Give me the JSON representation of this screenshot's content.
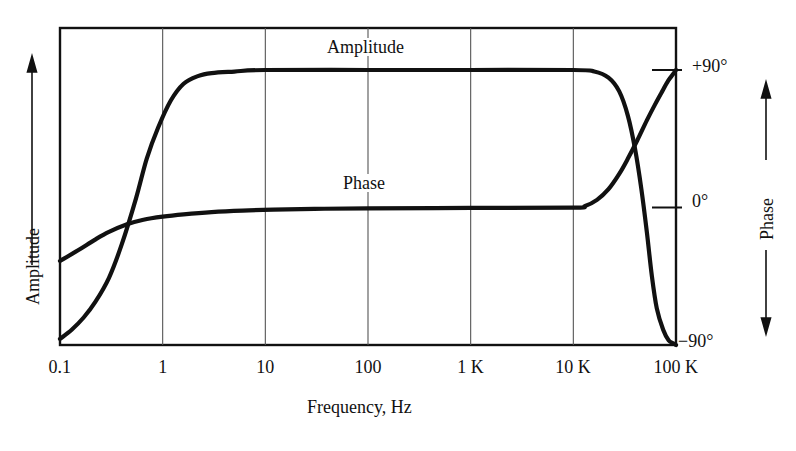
{
  "figure": {
    "background_color": "#ffffff",
    "ink_color": "#111111",
    "grid_color": "#555555"
  },
  "chart_data": {
    "type": "line",
    "title": "",
    "subtitle": "",
    "xlabel": "Frequency, Hz",
    "ylabel_left": "Amplitude",
    "ylabel_right": "Phase",
    "x_scale": "log",
    "x_tick_labels": [
      "0.1",
      "1",
      "10",
      "100",
      "1 K",
      "10 K",
      "100 K"
    ],
    "x_tick_values": [
      0.1,
      1,
      10,
      100,
      1000,
      10000,
      100000
    ],
    "xlim": [
      0.1,
      100000
    ],
    "y_right_tick_labels": [
      "+90°",
      "0°",
      "−90°"
    ],
    "y_right_tick_values": [
      90,
      0,
      -90
    ],
    "ylim_right": [
      -90,
      90
    ],
    "grid": true,
    "grid_axis": "x",
    "legend": "inline-labels",
    "series": [
      {
        "name": "Amplitude",
        "label": "Amplitude",
        "label_x": 100,
        "axis": "left",
        "points_xy": [
          [
            0.1,
            -86
          ],
          [
            0.13,
            -80
          ],
          [
            0.17,
            -72
          ],
          [
            0.22,
            -62
          ],
          [
            0.3,
            -46
          ],
          [
            0.4,
            -24
          ],
          [
            0.55,
            6
          ],
          [
            0.7,
            32
          ],
          [
            0.9,
            52
          ],
          [
            1.2,
            70
          ],
          [
            1.6,
            81
          ],
          [
            2.2,
            86
          ],
          [
            3,
            88
          ],
          [
            5,
            89
          ],
          [
            10,
            90
          ],
          [
            100,
            90
          ],
          [
            1000,
            90
          ],
          [
            10000,
            90
          ],
          [
            16000,
            89
          ],
          [
            22000,
            85
          ],
          [
            28000,
            76
          ],
          [
            34000,
            60
          ],
          [
            40000,
            38
          ],
          [
            46000,
            12
          ],
          [
            52000,
            -16
          ],
          [
            58000,
            -44
          ],
          [
            65000,
            -66
          ],
          [
            75000,
            -80
          ],
          [
            85000,
            -87
          ],
          [
            95000,
            -89
          ],
          [
            100000,
            -90
          ]
        ]
      },
      {
        "name": "Phase",
        "label": "Phase",
        "label_x": 100,
        "axis": "right",
        "points_xy": [
          [
            0.1,
            -35
          ],
          [
            0.15,
            -28
          ],
          [
            0.22,
            -21
          ],
          [
            0.3,
            -16
          ],
          [
            0.45,
            -11
          ],
          [
            0.65,
            -8
          ],
          [
            1,
            -6
          ],
          [
            1.6,
            -4.5
          ],
          [
            3,
            -3
          ],
          [
            6,
            -2
          ],
          [
            12,
            -1.4
          ],
          [
            30,
            -0.9
          ],
          [
            100,
            -0.6
          ],
          [
            1000,
            -0.3
          ],
          [
            10000,
            -0.1
          ],
          [
            13000,
            1
          ],
          [
            17000,
            5
          ],
          [
            22000,
            12
          ],
          [
            28000,
            22
          ],
          [
            34000,
            32
          ],
          [
            42000,
            44
          ],
          [
            52000,
            57
          ],
          [
            62000,
            67
          ],
          [
            72000,
            75
          ],
          [
            84000,
            83
          ],
          [
            93000,
            87
          ],
          [
            100000,
            90
          ]
        ]
      }
    ]
  },
  "axes": {
    "left_axis": {
      "label": "Amplitude",
      "arrow": "up",
      "arrow_type": "single"
    },
    "right_axis": {
      "label": "Phase",
      "arrow": "up-down",
      "arrow_type": "double"
    }
  }
}
